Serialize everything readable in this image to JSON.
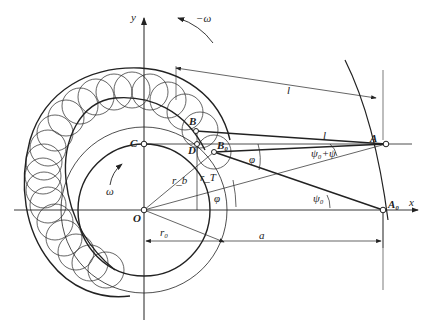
{
  "diagram": {
    "type": "cam-mechanism-roller-follower-synthesis",
    "labels": {
      "y_axis": "y",
      "x_axis": "x",
      "omega_neg": "−ω",
      "omega": "ω",
      "point_C": "C",
      "point_O": "O",
      "point_B": "B",
      "point_D": "D",
      "point_B0": "B₀",
      "point_A": "A",
      "point_A0": "A₀",
      "length_l_top": "l",
      "length_l_arm": "l",
      "length_a": "a",
      "radius_rb": "r_b",
      "radius_rT": "r_T",
      "radius_r0": "r₀",
      "angle_phi_upper": "φ",
      "angle_phi_lower": "φ",
      "angle_psi0_psi": "ψ₀+ψ",
      "angle_psi0": "ψ₀"
    },
    "points": {
      "O": [
        144,
        210
      ],
      "C": [
        144,
        144
      ],
      "A": [
        386,
        144
      ],
      "A0": [
        383,
        210
      ],
      "B": [
        196,
        131
      ],
      "D": [
        197,
        144
      ],
      "B0": [
        214,
        152
      ]
    },
    "colors": {
      "line": "#222222",
      "background": "#ffffff"
    }
  }
}
